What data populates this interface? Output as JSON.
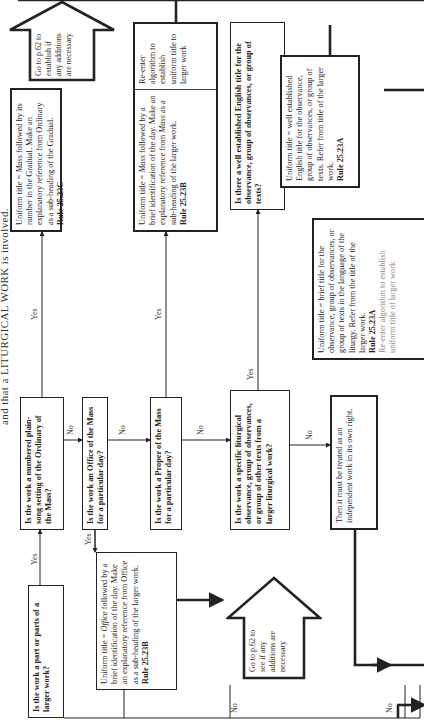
{
  "heading": "and that a LITURGICAL WORK is involved.",
  "labels": {
    "yes": "Yes",
    "no": "No"
  },
  "nodes": {
    "q_part_of_larger": {
      "text": "Is the work a part or parts of a larger work?"
    },
    "q_numbered_plainsong": {
      "text": "Is the work a numbered plain-song setting of the Ordinary of the Mass?"
    },
    "q_office": {
      "text": "Is the work an Office of the Mass for a particular day?"
    },
    "q_proper": {
      "text": "Is the work a Proper of the Mass for a particular day?"
    },
    "q_specific_liturgical": {
      "text": "Is the work a specific liturgical observance, group of observances, or group of other texts from a larger liturgical work?"
    },
    "q_english_title": {
      "text": "Is there a well established English title for the observance, group of observances, or group of texts?"
    },
    "r_office": {
      "pre": "Uniform title = ",
      "em": "Office",
      "post": " followed by a brief identification of the day. Make an explanatory reference from Office as a sub-heading of the larger work.",
      "rule": "Rule 25.23B"
    },
    "r_gradual": {
      "pre": "Uniform title = ",
      "em": "Mass",
      "post": " followed by its number in the Gradual. Make an explanatory reference from Ordinary as a sub-heading of the Gradual.",
      "rule": "Rule 25.23C"
    },
    "r_mass_day": {
      "pre": "Uniform title = ",
      "em": "Mass",
      "mid": " followed by a brief identification of the day. Make an explanatory reference from ",
      "em2": "Mass",
      "post": " as a sub-heading of the larger work.",
      "rule": "Rule 25.23B",
      "side": "Re-enter algorithm to establish uniform title to larger work"
    },
    "r_english": {
      "text": "Uniform title = well established English title for the observance, group of observances, or group of texts. Refer from title of the larger work.",
      "rule": "Rule 25.23A",
      "side": "Re-enter algorithm to establish uniform title of larger work"
    },
    "r_brief": {
      "text": "Uniform title = brief title for the observance, group of observances, or group of texts in the language of the liturgy. Refer from the title of the larger work.",
      "rule": "Rule 25.23A",
      "tail": "Re-enter algorithm to establish uniform title of larger work"
    },
    "r_independent": {
      "text": "Then it must be treated as an independent work in its own right."
    },
    "goto_top": {
      "text": "Go to p.62 to establish if any additions are necessary"
    },
    "goto_mid": {
      "text": "Go to p.62 to see if any additions are necessary"
    }
  }
}
